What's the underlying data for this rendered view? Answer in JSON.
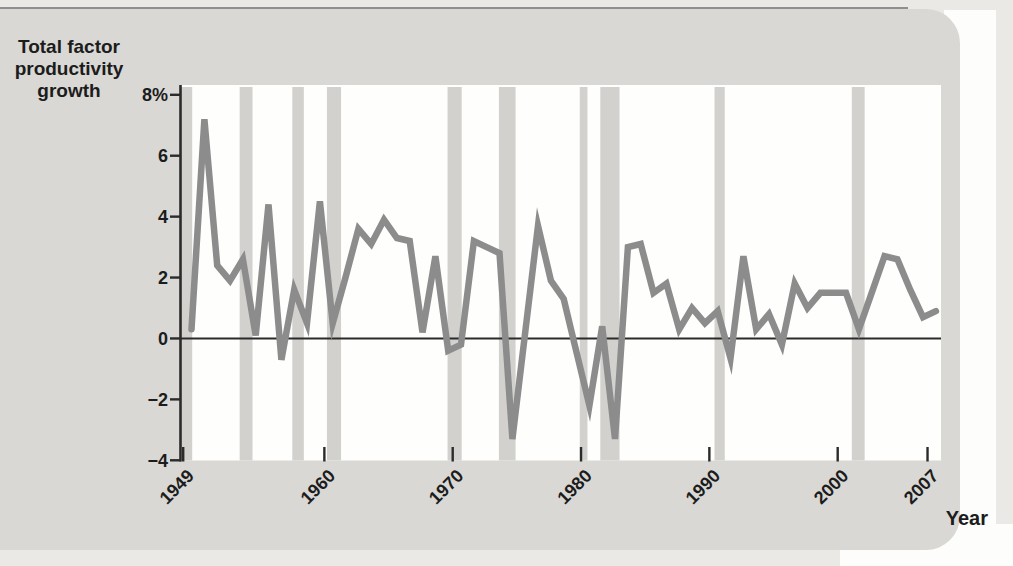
{
  "figure": {
    "y_axis_title_lines": [
      "Total factor",
      "productivity",
      "growth"
    ],
    "x_axis_title": "Year"
  },
  "chart_data": {
    "type": "line",
    "xlabel": "Year",
    "ylabel": "Total factor productivity growth",
    "ylim": [
      -4,
      8
    ],
    "x_domain": [
      1948.1,
      2007.4
    ],
    "grid": false,
    "zero_line": true,
    "legend": "none",
    "x": [
      1949,
      1950,
      1951,
      1952,
      1953,
      1954,
      1955,
      1956,
      1957,
      1958,
      1959,
      1960,
      1961,
      1962,
      1963,
      1964,
      1965,
      1966,
      1967,
      1968,
      1969,
      1970,
      1971,
      1972,
      1973,
      1974,
      1975,
      1976,
      1977,
      1978,
      1979,
      1980,
      1981,
      1982,
      1983,
      1984,
      1985,
      1986,
      1987,
      1988,
      1989,
      1990,
      1991,
      1992,
      1993,
      1994,
      1995,
      1996,
      1997,
      1998,
      1999,
      2000,
      2001,
      2002,
      2003,
      2004,
      2005,
      2006,
      2007
    ],
    "values": [
      0.3,
      7.2,
      2.4,
      1.9,
      2.6,
      0.1,
      4.4,
      -0.7,
      1.6,
      0.5,
      4.5,
      0.5,
      2.0,
      3.6,
      3.1,
      3.9,
      3.3,
      3.2,
      0.2,
      2.7,
      -0.4,
      -0.2,
      3.2,
      3.0,
      2.8,
      -3.3,
      0.2,
      3.7,
      1.9,
      1.3,
      -0.45,
      -2.2,
      0.4,
      -3.3,
      3.0,
      3.1,
      1.5,
      1.8,
      0.3,
      1.0,
      0.5,
      0.9,
      -0.65,
      2.7,
      0.3,
      0.8,
      -0.2,
      1.8,
      1.0,
      1.5,
      1.5,
      1.5,
      0.3,
      1.5,
      2.7,
      2.6,
      1.6,
      0.7,
      0.9
    ],
    "y_ticks": [
      {
        "value": 8,
        "label": "8%"
      },
      {
        "value": 6,
        "label": "6"
      },
      {
        "value": 4,
        "label": "4"
      },
      {
        "value": 2,
        "label": "2"
      },
      {
        "value": 0,
        "label": "0"
      },
      {
        "value": -2,
        "label": "−2"
      },
      {
        "value": -4,
        "label": "−4"
      }
    ],
    "x_ticks": [
      {
        "value": 1949,
        "label": "1949"
      },
      {
        "value": 1960,
        "label": "1960"
      },
      {
        "value": 1970,
        "label": "1970"
      },
      {
        "value": 1980,
        "label": "1980"
      },
      {
        "value": 1990,
        "label": "1990"
      },
      {
        "value": 2000,
        "label": "2000"
      },
      {
        "value": 2007,
        "label": "2007"
      }
    ],
    "recession_bands": [
      {
        "start": 1948.8,
        "end": 1949.7
      },
      {
        "start": 1953.4,
        "end": 1954.4
      },
      {
        "start": 1957.5,
        "end": 1958.4
      },
      {
        "start": 1960.2,
        "end": 1961.3
      },
      {
        "start": 1969.6,
        "end": 1970.7
      },
      {
        "start": 1973.6,
        "end": 1974.9
      },
      {
        "start": 1979.9,
        "end": 1980.5
      },
      {
        "start": 1981.5,
        "end": 1983.0
      },
      {
        "start": 1990.4,
        "end": 1991.2
      },
      {
        "start": 2001.1,
        "end": 2002.1
      }
    ],
    "colors": {
      "line": "#8c8c8c",
      "recession_band": "#d2d1ce",
      "plot_bg": "#fefefd",
      "axis": "#2b2b2b",
      "text": "#1c1c1c"
    }
  }
}
